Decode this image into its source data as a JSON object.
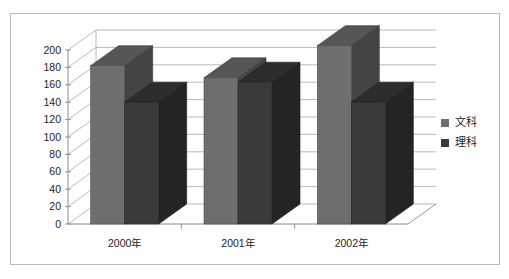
{
  "chart_data": {
    "type": "bar",
    "title": "",
    "xlabel": "",
    "ylabel": "",
    "categories": [
      "2000年",
      "2001年",
      "2002年"
    ],
    "series": [
      {
        "name": "文科",
        "color": "#6e6e6e",
        "values": [
          182,
          168,
          205
        ]
      },
      {
        "name": "理科",
        "color": "#3a3a3a",
        "values": [
          140,
          163,
          140
        ]
      }
    ],
    "ylim": [
      0,
      200
    ],
    "ytick_step": 20,
    "yticks": [
      "0",
      "20",
      "40",
      "60",
      "80",
      "100",
      "120",
      "140",
      "160",
      "180",
      "200"
    ],
    "grid": true,
    "three_d": true,
    "legend_position": "right",
    "legend_entries": [
      "文科",
      "理科"
    ]
  },
  "legend": {
    "items": [
      {
        "label": "文科",
        "color": "#6e6e6e"
      },
      {
        "label": "理科",
        "color": "#3a3a3a"
      }
    ]
  },
  "colors": {
    "series_light": "#6e6e6e",
    "series_dark": "#3a3a3a",
    "grid": "#a8a8a8",
    "axis": "#8a8a8a",
    "border": "#b9b9b9",
    "text": "#1d1d1d",
    "background": "#ffffff"
  }
}
